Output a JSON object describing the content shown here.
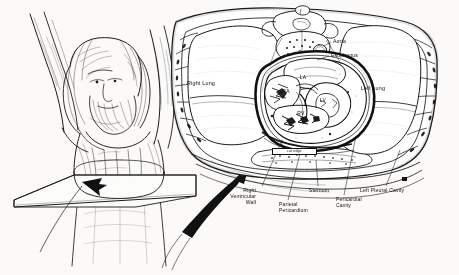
{
  "figure": {
    "background_color": "#f7f6f4",
    "ink_color": "#111111",
    "frame_color": "#1a1a1a",
    "width": 459,
    "height": 275
  },
  "left_panel": {
    "name": "cadaver-body-with-sectioning-plane",
    "description": "Line drawing of a bearded human figure with raised arms, lying with a flat transverse sectioning plane passing through the chest",
    "arrow_note": "Solid black arrow indicating the plane of section"
  },
  "right_panel": {
    "name": "thoracic-cross-section",
    "description": "Axial cut of the thorax showing both lungs, the pericardial sac, heart chambers, sternum, vertebra and great vessels"
  },
  "organ_labels": [
    {
      "id": "right-lung",
      "text": "Right Lung",
      "x": 200,
      "y": 83
    },
    {
      "id": "left-lung",
      "text": "Left Lung",
      "x": 372,
      "y": 88
    }
  ],
  "vessel_labels": [
    {
      "id": "aorta",
      "text": "Aorta",
      "x": 333,
      "y": 41
    },
    {
      "id": "esophagus",
      "text": "Esophagus",
      "x": 331,
      "y": 55
    }
  ],
  "chamber_labels": [
    {
      "id": "la",
      "text": "LA",
      "x": 303,
      "y": 78,
      "full": "Left Atrium"
    },
    {
      "id": "ra",
      "text": "RA",
      "x": 286,
      "y": 92,
      "full": "Right Atrium"
    },
    {
      "id": "lv",
      "text": "LV",
      "x": 322,
      "y": 100,
      "full": "Left Ventricle"
    },
    {
      "id": "rv",
      "text": "RV",
      "x": 301,
      "y": 113,
      "full": "Right Ventricle"
    }
  ],
  "callout_labels": [
    {
      "id": "right-ventricular-wall",
      "text": "Right\nVentricular\nWall",
      "align": "right",
      "x": 250,
      "y": 190
    },
    {
      "id": "parietal-pericardium",
      "text": "Parietal\nPericardium",
      "align": "left",
      "x": 282,
      "y": 203
    },
    {
      "id": "sternum",
      "text": "Sternum",
      "align": "center",
      "x": 318,
      "y": 190
    },
    {
      "id": "pericardial-cavity",
      "text": "Pericardial\nCavity",
      "align": "left",
      "x": 340,
      "y": 198
    },
    {
      "id": "left-pleural-cavity",
      "text": "Left Pleural Cavity",
      "align": "left",
      "x": 383,
      "y": 190
    }
  ],
  "boxed_note": {
    "id": "cut-edge-note",
    "text": "cut edge",
    "x": 273,
    "y": 150
  },
  "artist_mark": {
    "id": "artist-signature-mark",
    "x": 403,
    "y": 177
  }
}
